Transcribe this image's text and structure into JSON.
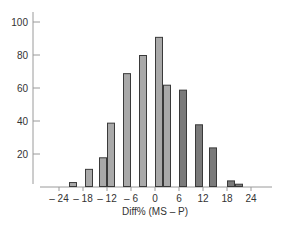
{
  "chart_data": {
    "type": "bar",
    "title": "",
    "xlabel": "Diff% (MS – P)",
    "ylabel": "",
    "ylim": [
      0,
      105
    ],
    "xlim": [
      -26,
      28
    ],
    "grid": false,
    "legend": null,
    "x_ticks": [
      "– 24",
      "– 18",
      "– 12",
      "– 6",
      "0",
      "6",
      "12",
      "18",
      "24"
    ],
    "x_tick_values": [
      -24,
      -18,
      -12,
      -6,
      0,
      6,
      12,
      18,
      24
    ],
    "y_ticks": [
      "20",
      "40",
      "60",
      "80",
      "100"
    ],
    "y_tick_values": [
      20,
      40,
      60,
      80,
      100
    ],
    "bars": [
      {
        "x0": -21.5,
        "x1": -19.5,
        "value": 3,
        "shade": "light"
      },
      {
        "x0": -17.5,
        "x1": -15.5,
        "value": 11,
        "shade": "light"
      },
      {
        "x0": -14.0,
        "x1": -12.0,
        "value": 18,
        "shade": "light"
      },
      {
        "x0": -12.0,
        "x1": -10.0,
        "value": 39,
        "shade": "light"
      },
      {
        "x0": -8.0,
        "x1": -6.0,
        "value": 69,
        "shade": "light"
      },
      {
        "x0": -4.0,
        "x1": -2.0,
        "value": 80,
        "shade": "light"
      },
      {
        "x0": 0.0,
        "x1": 2.0,
        "value": 91,
        "shade": "light"
      },
      {
        "x0": 2.0,
        "x1": 4.0,
        "value": 62,
        "shade": "light"
      },
      {
        "x0": 6.0,
        "x1": 8.0,
        "value": 59,
        "shade": "dark"
      },
      {
        "x0": 10.0,
        "x1": 12.0,
        "value": 38,
        "shade": "dark"
      },
      {
        "x0": 13.5,
        "x1": 15.5,
        "value": 24,
        "shade": "dark"
      },
      {
        "x0": 18.0,
        "x1": 20.0,
        "value": 4,
        "shade": "dark"
      },
      {
        "x0": 20.0,
        "x1": 22.0,
        "value": 2,
        "shade": "dark"
      }
    ],
    "colors": {
      "light": "#a9a9a9",
      "dark": "#7a7a7a",
      "stroke": "#3a3a3a",
      "axis": "#9a9a9a"
    }
  }
}
